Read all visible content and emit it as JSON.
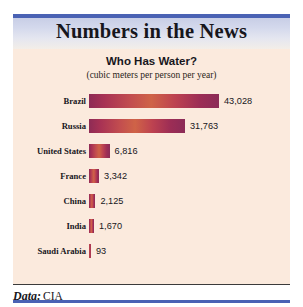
{
  "header": {
    "title": "Numbers in the News",
    "accent_color": "#4a62b4"
  },
  "footer": {
    "label": "Data:",
    "value": "CIA"
  },
  "chart_data": {
    "type": "bar",
    "orientation": "horizontal",
    "title": "Who Has Water?",
    "subtitle": "(cubic meters per person per year)",
    "xlabel": "",
    "ylabel": "",
    "categories": [
      "Brazil",
      "Russia",
      "United States",
      "France",
      "China",
      "India",
      "Saudi Arabia"
    ],
    "values": [
      43028,
      31763,
      6816,
      3342,
      2125,
      1670,
      93
    ],
    "value_labels": [
      "43,028",
      "31,763",
      "6,816",
      "3,342",
      "2,125",
      "1,670",
      "93"
    ],
    "xlim": [
      0,
      43028
    ],
    "grid": false,
    "legend": "none",
    "bar_color_start": "#8e2b55",
    "bar_color_mid": "#cf6347",
    "bar_color_end": "#8b2b57",
    "background_color": "#fbeadd"
  }
}
